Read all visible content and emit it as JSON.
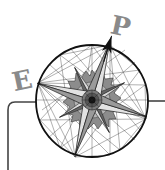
{
  "logo": {
    "letters": {
      "left": "E",
      "top": "P"
    },
    "description": "Compass rose emblem with geometric line rays inside a circle",
    "colors": {
      "background": "#ffffff",
      "line": "#1a1a1a",
      "letter": "#8a8a8a",
      "arm_light": "#d6d6d6",
      "arm_dark": "#555555",
      "ring": "#6a6a6a"
    }
  }
}
